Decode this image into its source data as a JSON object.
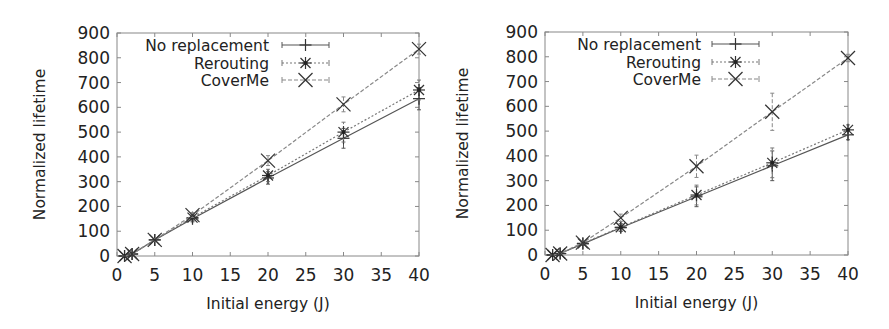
{
  "figure": {
    "colors": {
      "axis": "#888888",
      "text": "#222222",
      "no_replacement": "#555555",
      "rerouting": "#777777",
      "coverme": "#888888",
      "marker": "#333333"
    }
  },
  "chart_data": [
    {
      "type": "line",
      "title": "",
      "xlabel": "Initial energy (J)",
      "ylabel": "Normalized lifetime",
      "xlim": [
        0,
        40
      ],
      "ylim": [
        0,
        900
      ],
      "xticks": [
        0,
        5,
        10,
        15,
        20,
        25,
        30,
        35,
        40
      ],
      "yticks": [
        0,
        100,
        200,
        300,
        400,
        500,
        600,
        700,
        800,
        900
      ],
      "grid": false,
      "legend_position": "top-left-inside",
      "x": [
        1,
        2,
        5,
        10,
        20,
        30,
        40
      ],
      "series": [
        {
          "name": "No replacement",
          "marker": "plus",
          "line": "solid",
          "values": [
            0,
            8,
            65,
            150,
            315,
            475,
            635
          ],
          "errors": [
            2,
            3,
            5,
            12,
            25,
            40,
            45
          ]
        },
        {
          "name": "Rerouting",
          "marker": "star",
          "line": "dotted",
          "values": [
            0,
            8,
            65,
            155,
            325,
            500,
            670
          ],
          "errors": [
            2,
            3,
            5,
            12,
            25,
            40,
            40
          ]
        },
        {
          "name": "CoverMe",
          "marker": "x",
          "line": "dashed",
          "values": [
            0,
            8,
            65,
            165,
            385,
            612,
            835
          ],
          "errors": [
            2,
            3,
            5,
            10,
            20,
            30,
            20
          ]
        }
      ]
    },
    {
      "type": "line",
      "title": "",
      "xlabel": "Initial energy (J)",
      "ylabel": "Normalized lifetime",
      "xlim": [
        0,
        40
      ],
      "ylim": [
        0,
        900
      ],
      "xticks": [
        0,
        5,
        10,
        15,
        20,
        25,
        30,
        35,
        40
      ],
      "yticks": [
        0,
        100,
        200,
        300,
        400,
        500,
        600,
        700,
        800,
        900
      ],
      "grid": false,
      "legend_position": "top-left-inside",
      "x": [
        1,
        2,
        5,
        10,
        20,
        30,
        40
      ],
      "series": [
        {
          "name": "No replacement",
          "marker": "plus",
          "line": "solid",
          "values": [
            0,
            6,
            45,
            110,
            235,
            360,
            485
          ],
          "errors": [
            2,
            3,
            5,
            15,
            40,
            60,
            20
          ]
        },
        {
          "name": "Rerouting",
          "marker": "star",
          "line": "dotted",
          "values": [
            0,
            6,
            47,
            112,
            242,
            372,
            505
          ],
          "errors": [
            2,
            3,
            5,
            15,
            40,
            60,
            20
          ]
        },
        {
          "name": "CoverMe",
          "marker": "x",
          "line": "dashed",
          "values": [
            0,
            6,
            50,
            150,
            358,
            578,
            795
          ],
          "errors": [
            2,
            3,
            5,
            15,
            45,
            75,
            15
          ]
        }
      ]
    }
  ],
  "layout_frames": [
    {
      "left": 117,
      "top": 33,
      "right": 419,
      "bottom": 256,
      "ylabel_x": 45,
      "legend_text_right": 269,
      "legend_line_x0": 282,
      "legend_line_x1": 329,
      "legend_rows_y": [
        45,
        63,
        80
      ]
    },
    {
      "left": 545,
      "top": 32,
      "right": 848,
      "bottom": 255,
      "ylabel_x": 468,
      "legend_text_right": 701,
      "legend_line_x0": 712,
      "legend_line_x1": 759,
      "legend_rows_y": [
        44,
        62,
        79
      ]
    }
  ]
}
